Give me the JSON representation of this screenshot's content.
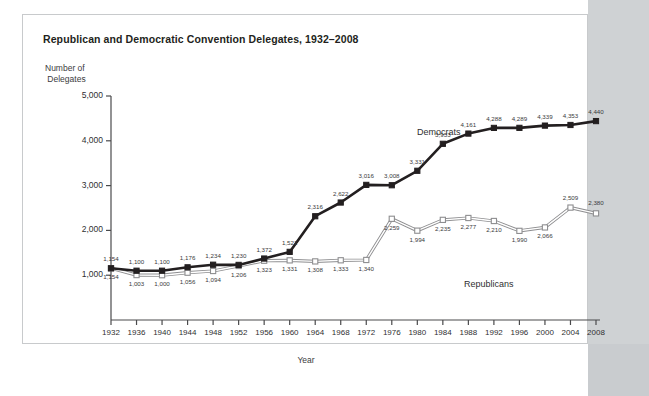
{
  "card": {
    "title": "Republican and Democratic Convention Delegates, 1932–2008",
    "y_axis_title": "Number of\n Delegates",
    "x_axis_title": "Year"
  },
  "labels": {
    "democrats": "Democrats",
    "republicans": "Republicans"
  },
  "colors": {
    "democrat_line": "#231f20",
    "republican_line": "#9a9a9c",
    "axis": "#4a4a4c",
    "text": "#2f2f31",
    "page_background": "#ffffff",
    "matte": "#cfd2d4",
    "card_background": "#ffffff"
  },
  "chart_data": {
    "type": "line",
    "title": "Republican and Democratic Convention Delegates, 1932–2008",
    "xlabel": "Year",
    "ylabel": "Number of Delegates",
    "ylim": [
      0,
      5000
    ],
    "yticks": [
      1000,
      2000,
      3000,
      4000,
      5000
    ],
    "ytick_labels": [
      "1,000",
      "2,000",
      "3,000",
      "4,000",
      "5,000"
    ],
    "grid": false,
    "legend_position": "inline-annotation",
    "categories": [
      1932,
      1936,
      1940,
      1944,
      1948,
      1952,
      1956,
      1960,
      1964,
      1968,
      1972,
      1976,
      1980,
      1984,
      1988,
      1992,
      1996,
      2000,
      2004,
      2008
    ],
    "xtick_labels": [
      "1932",
      "1936",
      "1940",
      "1944",
      "1948",
      "1952",
      "1956",
      "1960",
      "1964",
      "1968",
      "1972",
      "1976",
      "1980",
      "1984",
      "1988",
      "1992",
      "1996",
      "2000",
      "2004",
      "2008"
    ],
    "series": [
      {
        "name": "Democrats",
        "marker": "filled-square",
        "color": "#231f20",
        "values": [
          1154,
          1100,
          1100,
          1176,
          1234,
          1230,
          1372,
          1521,
          2316,
          2622,
          3016,
          3008,
          3331,
          3933,
          4161,
          4288,
          4289,
          4339,
          4353,
          4440
        ],
        "value_labels": [
          "1,154",
          "1,100",
          "1,100",
          "1,176",
          "1,234",
          "1,230",
          "1,372",
          "1,521",
          "2,316",
          "2,622",
          "3,016",
          "3,008",
          "3,331",
          "3,933",
          "4,161",
          "4,288",
          "4,289",
          "4,339",
          "4,353",
          "4,440"
        ]
      },
      {
        "name": "Republicans",
        "marker": "open-square",
        "color": "#9a9a9c",
        "values": [
          1154,
          1003,
          1000,
          1056,
          1094,
          1206,
          1323,
          1331,
          1308,
          1333,
          1340,
          2259,
          1994,
          2235,
          2277,
          2210,
          1990,
          2066,
          2509,
          2380
        ],
        "value_labels": [
          "1,154",
          "1,003",
          "1,000",
          "1,056",
          "1,094",
          "1,206",
          "1,323",
          "1,331",
          "1,308",
          "1,333",
          "1,340",
          "2,259",
          "1,994",
          "2,235",
          "2,277",
          "2,210",
          "1,990",
          "2,066",
          "2,509",
          "2,380"
        ]
      }
    ]
  }
}
